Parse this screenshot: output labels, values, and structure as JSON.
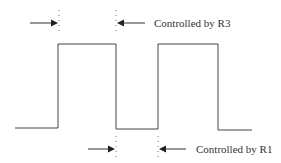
{
  "diagram": {
    "type": "square-wave timing",
    "labels": {
      "top": "Controlled by R3",
      "bottom": "Controlled by R1"
    },
    "colors": {
      "line": "#444444",
      "text": "#333333"
    }
  }
}
